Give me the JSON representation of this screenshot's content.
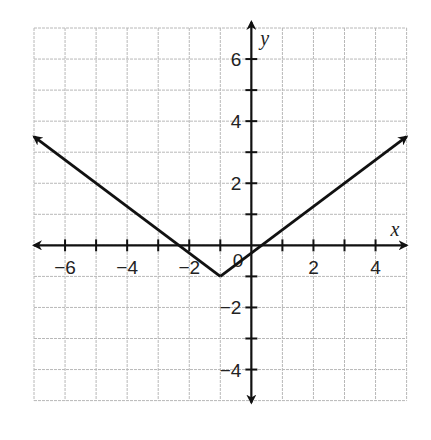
{
  "chart_data": {
    "type": "line",
    "title": "",
    "function": "y = 0.75|x + 1| - 1",
    "xlabel": "x",
    "ylabel": "y",
    "xlim": [
      -7,
      5
    ],
    "ylim": [
      -5,
      7
    ],
    "grid": true,
    "grid_step": 1,
    "x_tick_labels": [
      {
        "value": -6,
        "label": "-6"
      },
      {
        "value": -4,
        "label": "-4"
      },
      {
        "value": -2,
        "label": "-2"
      },
      {
        "value": 2,
        "label": "2"
      },
      {
        "value": 4,
        "label": "4"
      }
    ],
    "y_tick_labels": [
      {
        "value": 6,
        "label": "6"
      },
      {
        "value": 4,
        "label": "4"
      },
      {
        "value": 2,
        "label": "2"
      },
      {
        "value": -2,
        "label": "-2"
      },
      {
        "value": -4,
        "label": "-4"
      }
    ],
    "origin_label": "0",
    "series": [
      {
        "name": "absolute value function",
        "points": [
          [
            -7,
            3.5
          ],
          [
            -1,
            -1
          ],
          [
            5,
            3.5
          ]
        ],
        "vertex": [
          -1,
          -1
        ],
        "x_intercepts": [
          -2.33,
          0.33
        ],
        "arrows_at_ends": true,
        "color": "#111111"
      }
    ]
  },
  "colors": {
    "grid": "#b8b8b8",
    "axis": "#111111",
    "line": "#111111",
    "text": "#222222"
  }
}
